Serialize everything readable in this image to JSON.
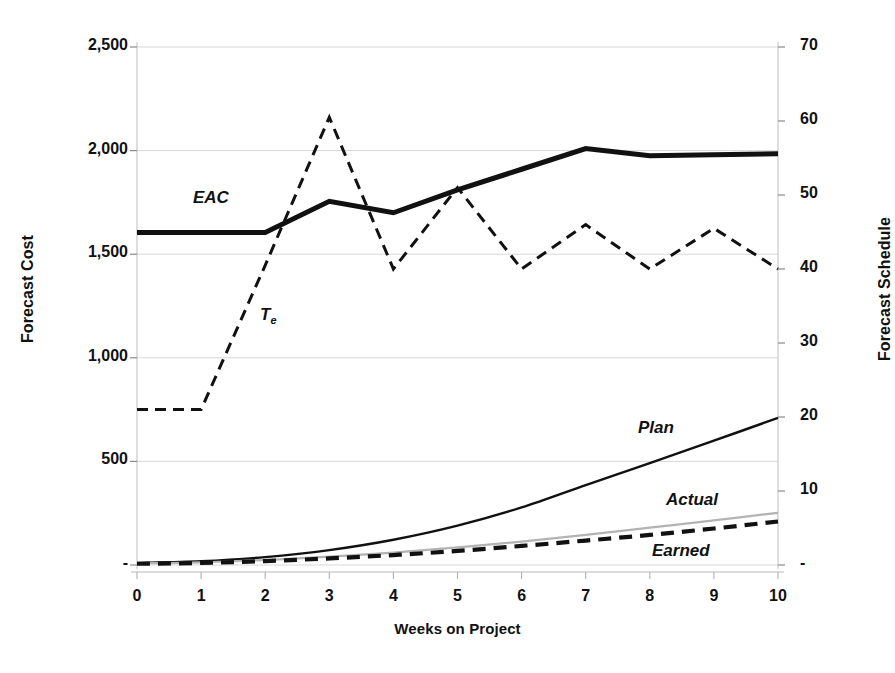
{
  "chart_data": {
    "type": "line",
    "title": "",
    "xlabel": "Weeks on Project",
    "ylabel": "Forecast Cost",
    "y2label": "Forecast Schedule",
    "x": [
      0,
      1,
      2,
      3,
      4,
      5,
      6,
      7,
      8,
      9,
      10
    ],
    "xlim": [
      0,
      10
    ],
    "ylim": [
      0,
      2500
    ],
    "y2lim": [
      0,
      70
    ],
    "grid": true,
    "legend_position": "inline-labels",
    "xticks": [
      "0",
      "1",
      "2",
      "3",
      "4",
      "5",
      "6",
      "7",
      "8",
      "9",
      "10"
    ],
    "yticks": [
      "-",
      "500",
      "1,000",
      "1,500",
      "2,000",
      "2,500"
    ],
    "ytick_values": [
      0,
      500,
      1000,
      1500,
      2000,
      2500
    ],
    "y2ticks": [
      "-",
      "10",
      "20",
      "30",
      "40",
      "50",
      "60",
      "70"
    ],
    "y2tick_values": [
      0,
      10,
      20,
      30,
      40,
      50,
      60,
      70
    ],
    "series": [
      {
        "name": "EAC",
        "axis": "left",
        "style": "solid-thick-black",
        "color": "#111111",
        "values": [
          1605,
          1605,
          1605,
          1755,
          1700,
          1810,
          1910,
          2010,
          1975,
          1980,
          1985
        ],
        "label": "EAC",
        "label_x": 193,
        "label_y": 188
      },
      {
        "name": "Te",
        "axis": "right",
        "style": "dashed-black",
        "color": "#111111",
        "values": [
          21,
          21,
          40.5,
          60.5,
          40,
          51,
          40,
          46,
          40,
          45.5,
          40
        ],
        "label": "T",
        "label_sub": "e",
        "label_x": 260,
        "label_y": 305
      },
      {
        "name": "Plan",
        "axis": "left",
        "style": "solid-thin-black",
        "color": "#111111",
        "values": [
          10,
          18,
          38,
          72,
          122,
          190,
          278,
          386,
          492,
          600,
          710
        ],
        "label": "Plan",
        "label_x": 638,
        "label_y": 418
      },
      {
        "name": "Actual",
        "axis": "left",
        "style": "solid-thin-gray",
        "color": "#b3b3b3",
        "values": [
          8,
          13,
          24,
          40,
          60,
          85,
          113,
          145,
          180,
          215,
          252
        ],
        "label": "Actual",
        "label_x": 666,
        "label_y": 490
      },
      {
        "name": "Earned",
        "axis": "left",
        "style": "dashed-thick-black",
        "color": "#111111",
        "values": [
          6,
          10,
          19,
          32,
          48,
          68,
          92,
          118,
          145,
          176,
          210
        ],
        "label": "Earned",
        "label_x": 652,
        "label_y": 541
      }
    ]
  },
  "axes": {
    "left_title": "Forecast Cost",
    "right_title": "Forecast Schedule",
    "x_title": "Weeks on Project"
  }
}
